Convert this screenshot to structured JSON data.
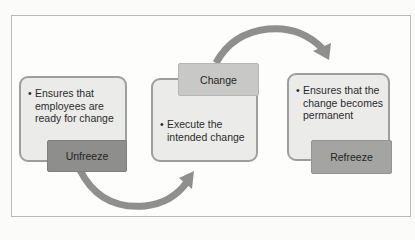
{
  "diagram": {
    "stages": [
      {
        "label": "Unfreeze",
        "description": "Ensures that employees are ready for change",
        "lines": [
          "Ensures that",
          "employees are",
          "ready for change"
        ]
      },
      {
        "label": "Change",
        "description": "Execute the intended change",
        "lines": [
          "Execute the",
          "intended change"
        ]
      },
      {
        "label": "Refreeze",
        "description": "Ensures that the change becomes permanent",
        "lines": [
          "Ensures that the",
          "change becomes",
          "permanent"
        ]
      }
    ],
    "bullet": "•",
    "colors": {
      "box_fill": "#ebebea",
      "box_border": "#9e9e9c",
      "unfreeze_label": "#8e8e8c",
      "change_label": "#c8c8c6",
      "refreeze_label": "#a4a4a2",
      "arrow": "#8f8f8d"
    },
    "arrows": [
      {
        "from": "Unfreeze",
        "to": "Change"
      },
      {
        "from": "Change",
        "to": "Refreeze"
      }
    ]
  }
}
